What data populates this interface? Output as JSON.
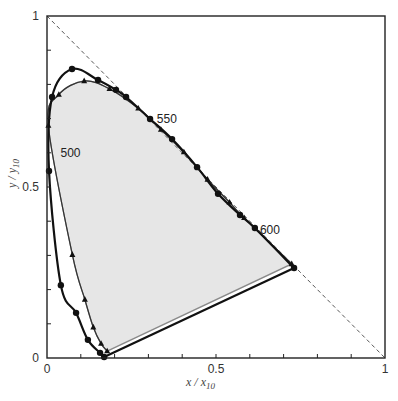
{
  "chart_data": {
    "type": "line",
    "title": "",
    "xlabel": "x / x10",
    "ylabel": "y / y10",
    "xlabel_main": "x / x",
    "xlabel_sub": "10",
    "ylabel_main": "y / y",
    "ylabel_sub": "10",
    "xlim": [
      0,
      1
    ],
    "ylim": [
      0,
      1
    ],
    "grid": false,
    "legend": null,
    "x_ticks": [
      0,
      0.1,
      0.2,
      0.3,
      0.4,
      0.5,
      0.6,
      0.7,
      0.8,
      0.9,
      1
    ],
    "y_ticks": [
      0,
      0.1,
      0.2,
      0.3,
      0.4,
      0.5,
      0.6,
      0.7,
      0.8,
      0.9,
      1
    ],
    "x_tick_labels": [
      {
        "value": 0,
        "label": "0"
      },
      {
        "value": 0.5,
        "label": "0.5"
      },
      {
        "value": 1,
        "label": "1"
      }
    ],
    "y_tick_labels": [
      {
        "value": 0,
        "label": "0"
      },
      {
        "value": 0.5,
        "label": "0.5"
      },
      {
        "value": 1,
        "label": "1"
      }
    ],
    "annotations": [
      {
        "text": "500",
        "x": 0.04,
        "y": 0.6
      },
      {
        "text": "550",
        "x": 0.325,
        "y": 0.7
      },
      {
        "text": "600",
        "x": 0.63,
        "y": 0.375
      }
    ],
    "reference_line": {
      "name": "x + y = 1",
      "style": "dashed",
      "points": [
        [
          0,
          1
        ],
        [
          1,
          0
        ]
      ]
    },
    "series": [
      {
        "name": "spectral locus x,y (2°) — circles",
        "marker": "circle",
        "style": "solid-bold",
        "points": [
          [
            0.169,
            0.003
          ],
          [
            0.157,
            0.015
          ],
          [
            0.121,
            0.053
          ],
          [
            0.086,
            0.132
          ],
          [
            0.041,
            0.213
          ],
          [
            0.006,
            0.547
          ],
          [
            0.015,
            0.763
          ],
          [
            0.074,
            0.845
          ],
          [
            0.151,
            0.813
          ],
          [
            0.204,
            0.784
          ],
          [
            0.234,
            0.763
          ],
          [
            0.305,
            0.699
          ],
          [
            0.37,
            0.64
          ],
          [
            0.444,
            0.558
          ],
          [
            0.506,
            0.48
          ],
          [
            0.571,
            0.418
          ],
          [
            0.615,
            0.38
          ],
          [
            0.731,
            0.263
          ]
        ]
      },
      {
        "name": "spectral locus x10,y10 (10°) — triangles",
        "marker": "triangle",
        "style": "solid-thin",
        "points": [
          [
            0.178,
            0.02
          ],
          [
            0.16,
            0.042
          ],
          [
            0.137,
            0.09
          ],
          [
            0.112,
            0.171
          ],
          [
            0.075,
            0.302
          ],
          [
            0.004,
            0.68
          ],
          [
            0.035,
            0.77
          ],
          [
            0.11,
            0.81
          ],
          [
            0.185,
            0.787
          ],
          [
            0.27,
            0.73
          ],
          [
            0.337,
            0.668
          ],
          [
            0.405,
            0.602
          ],
          [
            0.475,
            0.522
          ],
          [
            0.54,
            0.455
          ],
          [
            0.583,
            0.41
          ],
          [
            0.724,
            0.275
          ]
        ]
      }
    ],
    "filled_region": {
      "name": "gamut",
      "color": "#e3e3e3"
    },
    "purple_line": {
      "from": [
        0.169,
        0.003
      ],
      "to": [
        0.731,
        0.263
      ]
    }
  },
  "colors": {
    "frame": "#222222",
    "locus_main": "#111111",
    "locus_alt": "#8a8a8a",
    "fill": "#e6e6e6",
    "dashed": "#444444"
  }
}
